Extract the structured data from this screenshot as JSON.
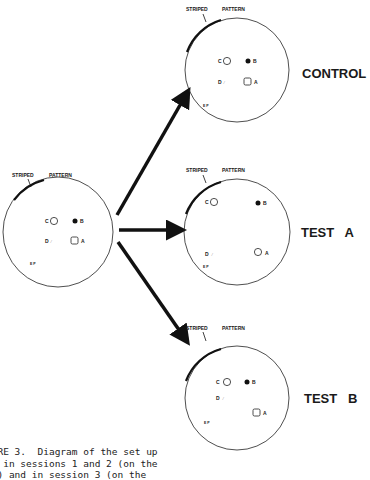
{
  "figure": {
    "striped_label": "STRIPED",
    "pattern_label": "PATTERN",
    "object_labels": {
      "a": "A",
      "b": "B",
      "c": "C",
      "d": "D",
      "ep": "E P"
    },
    "conditions": {
      "control": "CONTROL",
      "test_a": "TEST   A",
      "test_b": "TEST   B"
    },
    "caption_lines": [
      "GURE 3.  Diagram of the set up",
      "ed in sessions 1 and 2 (on the",
      "ft) and in session 3 (on the"
    ]
  }
}
